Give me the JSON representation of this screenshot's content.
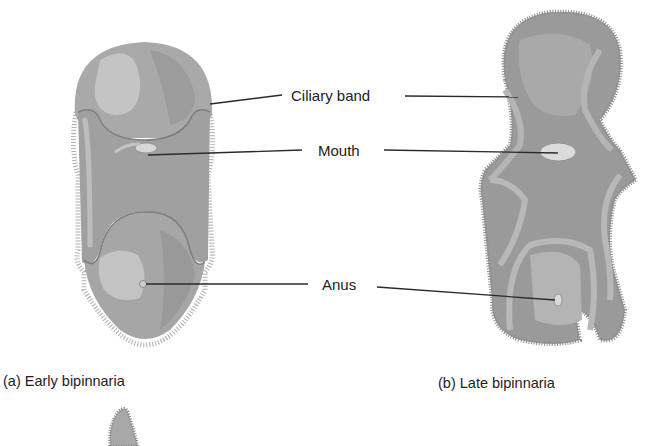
{
  "figure": {
    "labels": {
      "ciliary_band": "Ciliary band",
      "mouth": "Mouth",
      "anus": "Anus"
    },
    "captions": {
      "early": "(a) Early bipinnaria",
      "late": "(b) Late bipinnaria"
    },
    "colors": {
      "body_dark": "#8e8e8e",
      "body_mid": "#a4a4a4",
      "body_light": "#c2c2c2",
      "band": "#b0b0b0",
      "cilia": "#7a7a7a",
      "leader_line": "#2a2a2a",
      "text": "#222222"
    }
  }
}
